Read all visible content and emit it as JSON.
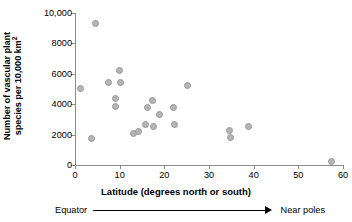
{
  "chart_data": {
    "type": "scatter",
    "title": "",
    "xlabel": "Latitude (degrees north or south)",
    "ylabel_line1": "Number of vascular plant",
    "ylabel_line2_prefix": "species per 10,000 km",
    "ylabel_line2_sup": "2",
    "xlim": [
      0,
      60
    ],
    "ylim": [
      0,
      10000
    ],
    "grid": false,
    "legend": null,
    "xticks": [
      0,
      10,
      20,
      30,
      40,
      50,
      60
    ],
    "xtick_labels": [
      "0",
      "10",
      "20",
      "30",
      "40",
      "50",
      "60"
    ],
    "yticks": [
      0,
      2000,
      4000,
      6000,
      8000,
      10000
    ],
    "ytick_labels": [
      "0",
      "2000",
      "4000",
      "6000",
      "8000",
      "10,000"
    ],
    "marker_color": "#b4b4b4",
    "marker_edge_color": "#9a9a9a",
    "axis_color": "#8b8b8b",
    "points": [
      {
        "x": 1.3,
        "y": 5050
      },
      {
        "x": 3.6,
        "y": 1750
      },
      {
        "x": 4.6,
        "y": 9300
      },
      {
        "x": 7.5,
        "y": 5400
      },
      {
        "x": 9.0,
        "y": 4400
      },
      {
        "x": 9.1,
        "y": 3850
      },
      {
        "x": 10.0,
        "y": 6250
      },
      {
        "x": 10.2,
        "y": 5450
      },
      {
        "x": 13.0,
        "y": 2100
      },
      {
        "x": 14.2,
        "y": 2180
      },
      {
        "x": 15.7,
        "y": 2650
      },
      {
        "x": 16.2,
        "y": 3800
      },
      {
        "x": 17.4,
        "y": 4250
      },
      {
        "x": 17.6,
        "y": 2540
      },
      {
        "x": 18.9,
        "y": 3320
      },
      {
        "x": 22.0,
        "y": 3800
      },
      {
        "x": 22.3,
        "y": 2640
      },
      {
        "x": 25.2,
        "y": 5200
      },
      {
        "x": 34.7,
        "y": 2260
      },
      {
        "x": 34.8,
        "y": 1790
      },
      {
        "x": 38.8,
        "y": 2560
      },
      {
        "x": 57.4,
        "y": 200
      }
    ],
    "annotation": {
      "left": "Equator",
      "right": "Near poles",
      "arrow": "right-arrow"
    }
  }
}
